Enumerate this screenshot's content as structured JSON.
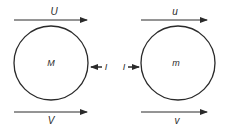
{
  "diagram": {
    "stroke_color": "#2a2a2a",
    "left_body": {
      "mass_label": "M",
      "top_velocity_label": "U",
      "bottom_velocity_label": "V",
      "force_label": "I"
    },
    "right_body": {
      "mass_label": "m",
      "top_velocity_label": "u",
      "bottom_velocity_label": "v",
      "force_label": "I"
    }
  }
}
